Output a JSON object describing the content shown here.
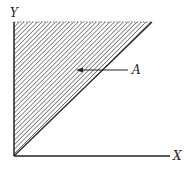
{
  "diagram": {
    "axes": {
      "x_label": "X",
      "y_label": "Y"
    },
    "region": {
      "label": "A",
      "shape": "triangle",
      "fill": "hatched",
      "bounded_by": [
        "y-axis",
        "line y = x",
        "top boundary (dashed)"
      ]
    },
    "colors": {
      "line": "#222222",
      "hatch": "#555555",
      "background": "#ffffff"
    }
  }
}
